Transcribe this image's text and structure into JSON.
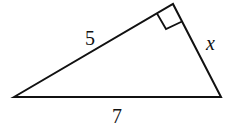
{
  "diagram": {
    "type": "right-triangle",
    "vertices": {
      "left": [
        14,
        97
      ],
      "top": [
        173,
        4
      ],
      "right": [
        221,
        97
      ]
    },
    "right_angle_at": "top",
    "labels": {
      "side_left": "5",
      "side_right": "x",
      "base": "7"
    },
    "stroke_color": "#111111"
  }
}
